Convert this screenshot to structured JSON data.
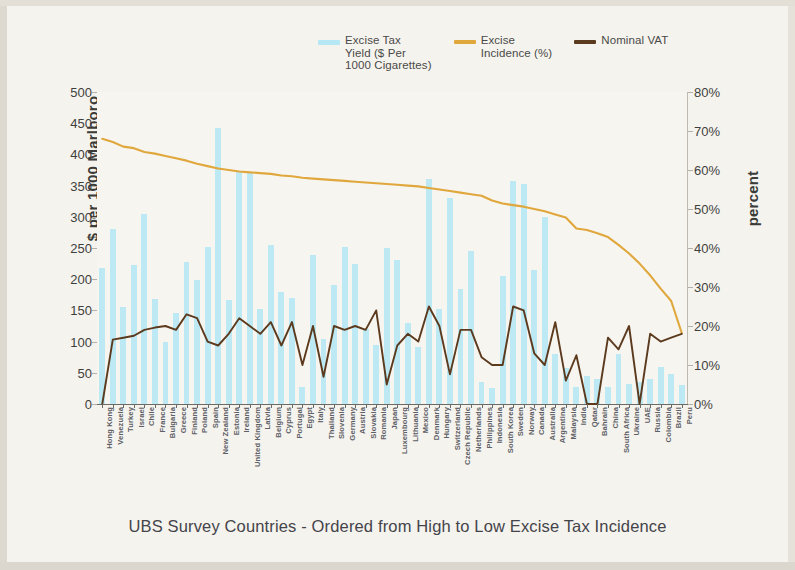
{
  "legend": {
    "items": [
      {
        "label": "Excise Tax\nYield ($ Per\n1000 Cigarettes)",
        "color": "#b6e7f4",
        "style": "bar"
      },
      {
        "label": "Excise\nIncidence (%)",
        "color": "#e0a73c",
        "style": "line"
      },
      {
        "label": "Nominal VAT",
        "color": "#5b3a1e",
        "style": "line"
      }
    ]
  },
  "axes": {
    "left_title": "$ per 1000 Marlboro",
    "right_title": "percent",
    "left_ticks": [
      "0",
      "50",
      "100",
      "150",
      "200",
      "250",
      "300",
      "350",
      "400",
      "450",
      "500"
    ],
    "right_ticks": [
      "0%",
      "10%",
      "20%",
      "30%",
      "40%",
      "50%",
      "60%",
      "70%",
      "80%"
    ]
  },
  "caption": "UBS Survey Countries - Ordered from High to Low Excise Tax Incidence",
  "chart_data": {
    "type": "bar",
    "title": "",
    "subtitle": "",
    "xlabel": "UBS Survey Countries - Ordered from High to Low Excise Tax Incidence",
    "ylabel": "$ per 1000 Marlboro",
    "ylabel_right": "percent",
    "ylim": [
      0,
      500
    ],
    "ylim_right": [
      0,
      80
    ],
    "grid": false,
    "legend_position": "top-center",
    "categories": [
      "Hong Kong",
      "Venezuela",
      "Turkey",
      "Israel",
      "Chile",
      "France",
      "Bulgaria",
      "Greece",
      "Finland",
      "Poland",
      "Spain",
      "New Zealand",
      "Estonia",
      "Ireland",
      "United Kingdom",
      "Latvia",
      "Belgium",
      "Cyprus",
      "Portugal",
      "Egypt",
      "Italy",
      "Thailand",
      "Slovenia",
      "Germany",
      "Austria",
      "Slovakia",
      "Romania",
      "Japan",
      "Luxembourg",
      "Lithuania",
      "Mexico",
      "Denmark",
      "Hungary",
      "Switzerland",
      "Czech Republic",
      "Netherlands",
      "Philippines",
      "Indonesia",
      "South Korea",
      "Sweden",
      "Norway",
      "Canada",
      "Australia",
      "Argentina",
      "Malaysia",
      "India",
      "Qatar",
      "Bahrain",
      "China",
      "South Africa",
      "Ukraine",
      "UAE",
      "Russia",
      "Colombia",
      "Brazil",
      "Peru"
    ],
    "series": [
      {
        "name": "Excise Tax Yield ($ Per 1000 Cigarettes)",
        "type": "bar",
        "axis": "left",
        "color": "#b6e7f4",
        "values": [
          218,
          281,
          155,
          222,
          305,
          168,
          100,
          146,
          228,
          198,
          252,
          443,
          167,
          374,
          372,
          153,
          255,
          180,
          170,
          28,
          239,
          104,
          190,
          251,
          225,
          120,
          95,
          250,
          230,
          130,
          92,
          360,
          152,
          330,
          185,
          245,
          35,
          25,
          205,
          357,
          352,
          215,
          300,
          80,
          57,
          28,
          45,
          40,
          27,
          80,
          32,
          36,
          40,
          60,
          48,
          30
        ]
      },
      {
        "name": "Excise Incidence (%)",
        "type": "line",
        "axis": "right",
        "color": "#e0a73c",
        "values": [
          68.0,
          67.2,
          66.0,
          65.6,
          64.6,
          64.2,
          63.6,
          63.0,
          62.4,
          61.6,
          61.0,
          60.4,
          60.0,
          59.6,
          59.4,
          59.2,
          59.0,
          58.6,
          58.4,
          58.0,
          57.8,
          57.6,
          57.4,
          57.2,
          57.0,
          56.8,
          56.6,
          56.4,
          56.2,
          56.0,
          55.8,
          55.4,
          55.0,
          54.6,
          54.2,
          53.8,
          53.4,
          52.2,
          51.4,
          51.0,
          50.6,
          50.0,
          49.4,
          48.6,
          47.8,
          45.0,
          44.6,
          43.8,
          42.8,
          40.8,
          38.6,
          36.0,
          33.0,
          29.6,
          26.4,
          18.2
        ]
      },
      {
        "name": "Nominal VAT",
        "type": "line",
        "axis": "right",
        "color": "#5b3a1e",
        "values": [
          0.0,
          16.5,
          17.0,
          17.5,
          19.0,
          19.6,
          20.0,
          19.0,
          23.0,
          22.0,
          16.0,
          15.0,
          18.0,
          22.0,
          20.0,
          18.0,
          21.0,
          15.0,
          21.0,
          10.0,
          20.0,
          7.0,
          20.0,
          19.0,
          20.0,
          19.0,
          24.0,
          5.0,
          15.0,
          18.0,
          16.0,
          25.0,
          20.0,
          7.6,
          19.0,
          19.0,
          12.0,
          10.0,
          10.0,
          25.0,
          24.0,
          13.0,
          10.0,
          21.0,
          6.0,
          12.5,
          0.0,
          0.0,
          17.0,
          14.0,
          20.0,
          0.0,
          18.0,
          16.0,
          17.0,
          18.0
        ]
      }
    ]
  }
}
